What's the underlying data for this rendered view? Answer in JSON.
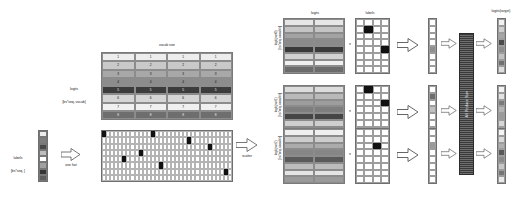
{
  "diagram": {
    "left": {
      "vocab_size_label": "vocab size",
      "logits_label_line1": "logits",
      "logits_label_line2": "[bs*seq, vocab]",
      "labels_label_line1": "labels",
      "labels_label_line2": "[bs*seq, ]",
      "one_hot_label": "one hot",
      "scatter_label": "scatter",
      "logits_rows": [
        [
          "1",
          "1",
          "1",
          "1"
        ],
        [
          "2",
          "2",
          "2",
          "2"
        ],
        [
          "3",
          "3",
          "3",
          "3"
        ],
        [
          "4",
          "4",
          "4",
          "4"
        ],
        [
          "5",
          "5",
          "5",
          "5"
        ],
        [
          "6",
          "6",
          "6",
          "6"
        ],
        [
          "7",
          "7",
          "7",
          "7"
        ],
        [
          "8",
          "8",
          "8",
          "8"
        ]
      ],
      "logits_row_shades": [
        "#ededed",
        "#c9c9c9",
        "#a8a8a8",
        "#8c8c8c",
        "#3c3c3c",
        "#d6d6d6",
        "#f0f0f0",
        "#6e6e6e"
      ],
      "labels_col_shades": [
        "#ededed",
        "#7d7d7d",
        "#494949",
        "#bdbdbd",
        "#ffffff",
        "#a0a0a0",
        "#333333",
        "#5c5c5c"
      ],
      "one_hot_cols": 32,
      "one_hot_rows": 8,
      "one_hot_active": [
        [
          0,
          0
        ],
        [
          12,
          0
        ],
        [
          21,
          1
        ],
        [
          26,
          2
        ],
        [
          9,
          3
        ],
        [
          5,
          4
        ],
        [
          14,
          5
        ],
        [
          30,
          6
        ]
      ]
    },
    "right": {
      "header_logits_line1": "logits",
      "header_logits_line2": "[bs*seq, vocab/n]",
      "header_labels_line1": "labels",
      "header_labels_line2": "[bs*seq, vocab/n]",
      "header_target": "logits(target)",
      "allreduce_label": "All Reduce Sum",
      "plus_symbol": "*",
      "parts": [
        {
          "row_label_line1": "logit(part0)",
          "row_label_line2": "[bs*seq, vocab/n]",
          "logits_shades": [
            "#e6e6e6",
            "#c4c4c4",
            "#a3a3a3",
            "#8a8a8a",
            "#3a3a3a",
            "#d2d2d2",
            "#efefef",
            "#6b6b6b"
          ],
          "labels_active": [
            [
              1,
              1
            ],
            [
              3,
              4
            ]
          ],
          "vector_shades": [
            "#ffffff",
            "#ffffff",
            "#ffffff",
            "#ffffff",
            "#8f8f8f",
            "#ffffff",
            "#ffffff",
            "#ffffff"
          ]
        },
        {
          "row_label_line1": "logit(part1)",
          "row_label_line2": "[bs*seq, vocab/n]",
          "logits_shades": [
            "#dcdcdc",
            "#b9b9b9",
            "#9d9d9d",
            "#7e7e7e",
            "#454545",
            "#cfcfcf",
            "#ececec",
            "#767676"
          ],
          "labels_active": [
            [
              1,
              0
            ],
            [
              3,
              2
            ]
          ],
          "vector_shades": [
            "#ffffff",
            "#6d6d6d",
            "#ffffff",
            "#c0c0c0",
            "#ffffff",
            "#ffffff",
            "#ffffff",
            "#ffffff"
          ]
        },
        {
          "row_label_line1": "logit(part2)",
          "row_label_line2": "[bs*seq, vocab/n]",
          "logits_shades": [
            "#efefef",
            "#cdcdcd",
            "#ababab",
            "#868686",
            "#5a5a5a",
            "#bcbcbc",
            "#e4e4e4",
            "#9a9a9a"
          ],
          "labels_active": [
            [
              2,
              2
            ]
          ],
          "vector_shades": [
            "#ffffff",
            "#ffffff",
            "#9b9b9b",
            "#ffffff",
            "#ffffff",
            "#ffffff",
            "#ffffff",
            "#ffffff"
          ]
        }
      ],
      "target_shades": [
        "#f2f2f2",
        "#cfcfcf",
        "#a6a6a6",
        "#4a4a4a",
        "#8d8d8d",
        "#c2c2c2",
        "#707070",
        "#dedede"
      ],
      "target_shades_2": [
        "#f2f2f2",
        "#e2e2e2",
        "#7a7a7a",
        "#b5b5b5",
        "#9c9c9c",
        "#d6d6d6",
        "#606060",
        "#ededed"
      ],
      "target_shades_3": [
        "#f5f5f5",
        "#d9d9d9",
        "#b0b0b0",
        "#585858",
        "#8a8a8a",
        "#c7c7c7",
        "#767676",
        "#e9e9e9"
      ]
    },
    "colors": {
      "ink": "#1a1a1a",
      "grid_line": "#9a9a9a",
      "highlight": "#111111",
      "bar_dark": "#3a3a3a"
    }
  }
}
